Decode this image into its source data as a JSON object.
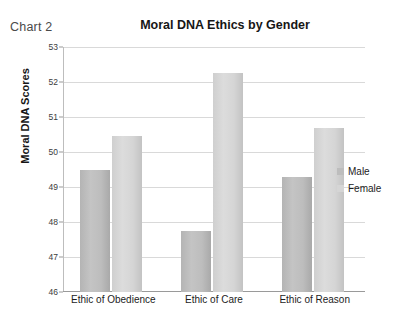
{
  "corner_label": "Chart 2",
  "chart_data": {
    "type": "bar",
    "title": "Moral DNA Ethics by Gender",
    "xlabel": "",
    "ylabel": "Moral DNA Scores",
    "ylim": [
      46,
      53
    ],
    "ytick_step": 1,
    "yticks": [
      53,
      52,
      51,
      50,
      49,
      48,
      47,
      46
    ],
    "ytick_labels": [
      "53",
      "52",
      "51",
      "50",
      "49",
      "48",
      "47",
      "46"
    ],
    "grid": "horizontal",
    "legend_position": "right",
    "categories": [
      "Ethic of Obedience",
      "Ethic of Care",
      "Ethic of Reason"
    ],
    "series": [
      {
        "name": "Male",
        "color": "#bdbdbd",
        "values": [
          49.5,
          47.75,
          49.3
        ]
      },
      {
        "name": "Female",
        "color": "#d5d5d5",
        "values": [
          50.45,
          52.25,
          50.7
        ]
      }
    ]
  }
}
